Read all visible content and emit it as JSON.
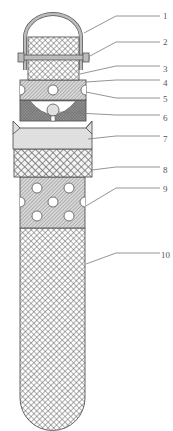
{
  "diagram": {
    "title": "",
    "parts": [
      {
        "id": "1",
        "label": "1",
        "name": "handle"
      },
      {
        "id": "2",
        "label": "2",
        "name": "bolt"
      },
      {
        "id": "3",
        "label": "3",
        "name": "upper-mesh-block"
      },
      {
        "id": "4",
        "label": "4",
        "name": "perforated-disc"
      },
      {
        "id": "5",
        "label": "5",
        "name": "side-hole"
      },
      {
        "id": "6",
        "label": "6",
        "name": "valve-ball-seat"
      },
      {
        "id": "7",
        "label": "7",
        "name": "dotted-collar"
      },
      {
        "id": "8",
        "label": "8",
        "name": "crosshatch-ring"
      },
      {
        "id": "9",
        "label": "9",
        "name": "perforated-section"
      },
      {
        "id": "10",
        "label": "10",
        "name": "mesh-tube"
      }
    ],
    "colors": {
      "line": "#555555",
      "leader": "#7a7a7a",
      "background": "#ffffff"
    }
  }
}
